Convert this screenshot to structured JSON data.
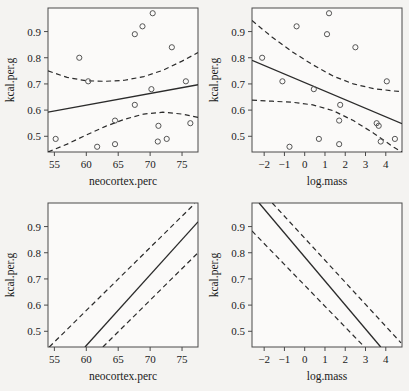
{
  "figure": {
    "background": "#f4f3f1",
    "panel_background": "#fbfaf9",
    "ink": "#2b2b2b",
    "layout": "2x2 grid of regression panels"
  },
  "chart_data": [
    {
      "id": "panel-top-left",
      "type": "scatter",
      "title": "",
      "xlabel": "neocortex.perc",
      "ylabel": "kcal.per.g",
      "xlim": [
        54.0,
        77.5
      ],
      "ylim": [
        0.44,
        0.99
      ],
      "xticks": [
        55,
        60,
        65,
        70,
        75
      ],
      "yticks": [
        0.5,
        0.6,
        0.7,
        0.8,
        0.9
      ],
      "grid": false,
      "legend": "none",
      "points": [
        {
          "x": 55.2,
          "y": 0.49
        },
        {
          "x": 58.9,
          "y": 0.8
        },
        {
          "x": 60.3,
          "y": 0.71
        },
        {
          "x": 61.7,
          "y": 0.46
        },
        {
          "x": 64.5,
          "y": 0.47
        },
        {
          "x": 64.5,
          "y": 0.56
        },
        {
          "x": 67.6,
          "y": 0.62
        },
        {
          "x": 67.6,
          "y": 0.89
        },
        {
          "x": 68.8,
          "y": 0.92
        },
        {
          "x": 70.2,
          "y": 0.68
        },
        {
          "x": 70.4,
          "y": 0.97
        },
        {
          "x": 71.2,
          "y": 0.48
        },
        {
          "x": 71.3,
          "y": 0.54
        },
        {
          "x": 72.6,
          "y": 0.49
        },
        {
          "x": 73.4,
          "y": 0.84
        },
        {
          "x": 75.6,
          "y": 0.71
        },
        {
          "x": 76.3,
          "y": 0.55
        }
      ],
      "fit_line": {
        "x": [
          54.0,
          77.5
        ],
        "y": [
          0.592,
          0.697
        ]
      },
      "upper_band": {
        "x": [
          54.0,
          57.0,
          60.0,
          63.0,
          66.0,
          69.0,
          72.0,
          75.0,
          77.5
        ],
        "y": [
          0.75,
          0.725,
          0.712,
          0.71,
          0.714,
          0.728,
          0.752,
          0.787,
          0.82
        ]
      },
      "lower_band": {
        "x": [
          54.0,
          57.0,
          60.0,
          63.0,
          66.0,
          69.0,
          72.0,
          75.0,
          77.5
        ],
        "y": [
          0.432,
          0.47,
          0.505,
          0.538,
          0.565,
          0.585,
          0.592,
          0.585,
          0.572
        ]
      }
    },
    {
      "id": "panel-top-right",
      "type": "scatter",
      "title": "",
      "xlabel": "log.mass",
      "ylabel": "kcal.per.g",
      "xlim": [
        -2.6,
        4.8
      ],
      "ylim": [
        0.44,
        0.99
      ],
      "xticks": [
        -2,
        -1,
        0,
        1,
        2,
        3,
        4
      ],
      "yticks": [
        0.5,
        0.6,
        0.7,
        0.8,
        0.9
      ],
      "grid": false,
      "legend": "none",
      "points": [
        {
          "x": -2.1,
          "y": 0.8
        },
        {
          "x": -1.1,
          "y": 0.71
        },
        {
          "x": -0.75,
          "y": 0.46
        },
        {
          "x": -0.4,
          "y": 0.92
        },
        {
          "x": 0.45,
          "y": 0.68
        },
        {
          "x": 0.7,
          "y": 0.49
        },
        {
          "x": 1.1,
          "y": 0.89
        },
        {
          "x": 1.2,
          "y": 0.97
        },
        {
          "x": 1.7,
          "y": 0.47
        },
        {
          "x": 1.7,
          "y": 0.56
        },
        {
          "x": 1.75,
          "y": 0.62
        },
        {
          "x": 2.5,
          "y": 0.84
        },
        {
          "x": 3.55,
          "y": 0.55
        },
        {
          "x": 3.65,
          "y": 0.54
        },
        {
          "x": 3.75,
          "y": 0.48
        },
        {
          "x": 4.05,
          "y": 0.71
        },
        {
          "x": 4.45,
          "y": 0.49
        }
      ],
      "fit_line": {
        "x": [
          -2.6,
          4.8
        ],
        "y": [
          0.79,
          0.548
        ]
      },
      "upper_band": {
        "x": [
          -2.6,
          -1.6,
          -0.6,
          0.4,
          1.4,
          2.4,
          3.4,
          4.4,
          4.8
        ],
        "y": [
          0.942,
          0.878,
          0.822,
          0.773,
          0.73,
          0.7,
          0.682,
          0.673,
          0.671
        ]
      },
      "lower_band": {
        "x": [
          -2.6,
          -1.6,
          -0.6,
          0.4,
          1.4,
          2.4,
          3.4,
          4.4,
          4.8
        ],
        "y": [
          0.638,
          0.634,
          0.63,
          0.62,
          0.598,
          0.56,
          0.512,
          0.458,
          0.436
        ]
      }
    },
    {
      "id": "panel-bottom-left",
      "type": "line",
      "title": "",
      "xlabel": "neocortex.perc",
      "ylabel": "kcal.per.g",
      "xlim": [
        54.0,
        77.5
      ],
      "ylim": [
        0.44,
        0.99
      ],
      "xticks": [
        55,
        60,
        65,
        70,
        75
      ],
      "yticks": [
        0.5,
        0.6,
        0.7,
        0.8,
        0.9
      ],
      "grid": false,
      "legend": "none",
      "points": [],
      "fit_line": {
        "x": [
          59.8,
          77.5
        ],
        "y": [
          0.437,
          0.918
        ]
      },
      "upper_band": {
        "x": [
          54.2,
          77.0
        ],
        "y": [
          0.437,
          0.988
        ]
      },
      "lower_band": {
        "x": [
          62.6,
          77.5
        ],
        "y": [
          0.437,
          0.8
        ]
      }
    },
    {
      "id": "panel-bottom-right",
      "type": "line",
      "title": "",
      "xlabel": "log.mass",
      "ylabel": "kcal.per.g",
      "xlim": [
        -2.6,
        4.8
      ],
      "ylim": [
        0.44,
        0.99
      ],
      "xticks": [
        -2,
        -1,
        0,
        1,
        2,
        3,
        4
      ],
      "yticks": [
        0.5,
        0.6,
        0.7,
        0.8,
        0.9
      ],
      "grid": false,
      "legend": "none",
      "points": [],
      "fit_line": {
        "x": [
          -2.25,
          3.75
        ],
        "y": [
          0.995,
          0.437
        ]
      },
      "upper_band": {
        "x": [
          -1.6,
          4.75
        ],
        "y": [
          0.995,
          0.456
        ]
      },
      "lower_band": {
        "x": [
          -2.6,
          2.95
        ],
        "y": [
          0.883,
          0.437
        ]
      }
    }
  ],
  "labels": {
    "y_axis_title": "kcal.per.g",
    "x_axis_title_left": "neocortex.perc",
    "x_axis_title_right": "log.mass"
  }
}
